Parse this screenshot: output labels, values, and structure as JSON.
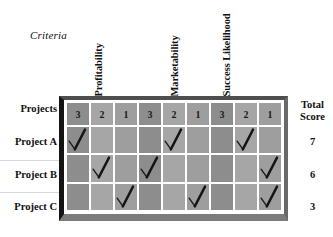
{
  "figure": {
    "criteria_caption": "Criteria",
    "row_header_label": "Projects",
    "total_header_line1": "Total",
    "total_header_line2": "Score",
    "check_icon_name": "check-mark-icon",
    "colors": {
      "table_fill": "#9a9a9a",
      "grid_line": "#ffffff",
      "frame_dark": "#141414",
      "frame_gray": "#7c7c7c",
      "text": "#111111"
    }
  },
  "criteria": [
    {
      "label": "Profitability"
    },
    {
      "label": "Marketability"
    },
    {
      "label": "Success Likelihood"
    }
  ],
  "score_header": {
    "values": [
      "3",
      "2",
      "1",
      "3",
      "2",
      "1",
      "3",
      "2",
      "1"
    ]
  },
  "projects": [
    {
      "name": "Project A",
      "total": "7"
    },
    {
      "name": "Project B",
      "total": "6"
    },
    {
      "name": "Project C",
      "total": "3"
    }
  ],
  "chart_data": {
    "type": "table",
    "xlabel": "Criteria scores",
    "ylabel": "Projects",
    "criteria": [
      "Profitability",
      "Marketability",
      "Success Likelihood"
    ],
    "columns": [
      "3",
      "2",
      "1",
      "3",
      "2",
      "1",
      "3",
      "2",
      "1"
    ],
    "rows": [
      {
        "name": "Project A",
        "checks": [
          1,
          0,
          0,
          0,
          1,
          0,
          0,
          1,
          0
        ],
        "scores": {
          "Profitability": 3,
          "Marketability": 2,
          "Success Likelihood": 2
        },
        "total": 7
      },
      {
        "name": "Project B",
        "checks": [
          0,
          1,
          0,
          1,
          0,
          0,
          0,
          0,
          1
        ],
        "scores": {
          "Profitability": 2,
          "Marketability": 3,
          "Success Likelihood": 1
        },
        "total": 6
      },
      {
        "name": "Project C",
        "checks": [
          0,
          0,
          1,
          0,
          0,
          1,
          0,
          0,
          1
        ],
        "scores": {
          "Profitability": 1,
          "Marketability": 1,
          "Success Likelihood": 1
        },
        "total": 3
      }
    ],
    "totals": [
      7,
      6,
      3
    ],
    "grid": true,
    "legend": "none"
  }
}
